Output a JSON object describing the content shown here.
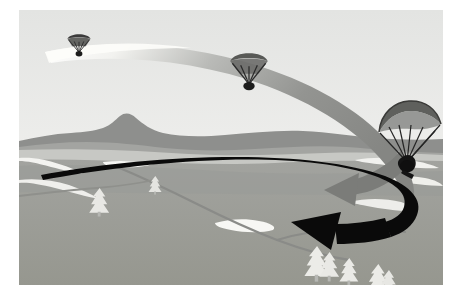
{
  "scene": {
    "title": "Paraglider landing approach diagram",
    "subject": "paragliding flight path over hilly terrain",
    "canvas": {
      "width": 462,
      "height": 302,
      "background": "#ffffff"
    },
    "frame": {
      "x": 19,
      "y": 10,
      "width": 424,
      "height": 275
    }
  },
  "palette": {
    "page_background": "#ffffff",
    "sky_top": "#e6e7e6",
    "sky_bottom": "#f2f2f0",
    "far_ridge": "#8e8f8d",
    "mid_ridge": "#a3a4a1",
    "valley_floor": "#c9c9c6",
    "foreground_field": "#9b9c99",
    "foreground_field_dark": "#949592",
    "track_path": "#8a8b88",
    "snow_patch": "#f4f4f1",
    "trail_band": "#8d8e8c",
    "trail_band_light": "#fafaf7",
    "flight_path_black": "#0a0a0a",
    "arrow_gray": "#7b7c79",
    "tree_light": "#e8e8e4",
    "tree_shadow": "#b6b7b3",
    "glider_dark": "#2a2a2a",
    "glider_canopy": "#6f706d"
  },
  "sky": {
    "label": "Sky",
    "gradient_from": "#e4e5e3",
    "gradient_to": "#f4f4f2"
  },
  "terrain": {
    "label": "Terrain",
    "bands": [
      {
        "name": "far-ridge-line",
        "color": "#8e8f8d",
        "description": "distant dark ridge with peak"
      },
      {
        "name": "mid-ridge-line",
        "color": "#a3a4a1",
        "description": "lighter middle ridge"
      },
      {
        "name": "valley-floor",
        "color": "#c9c9c6",
        "description": "pale valley between ridges"
      },
      {
        "name": "foreground-field",
        "color": "#9b9c99",
        "description": "large foreground meadow"
      }
    ],
    "features": [
      {
        "name": "snow-streak-left",
        "color": "#f4f4f1"
      },
      {
        "name": "snow-streak-center",
        "color": "#f4f4f1"
      },
      {
        "name": "snow-streak-right",
        "color": "#f4f4f1"
      },
      {
        "name": "winding-track",
        "color": "#8a8b88"
      }
    ]
  },
  "gliders": [
    {
      "id": "glider-far",
      "label": "Paraglider at altitude (far)",
      "stage": "high approach",
      "x": 78,
      "y": 40,
      "scale": 0.34,
      "canopy_color": "#3b3b3b",
      "pilot_color": "#1d1d1d"
    },
    {
      "id": "glider-mid",
      "label": "Paraglider descending (mid)",
      "stage": "downwind leg",
      "x": 248,
      "y": 57,
      "scale": 0.52,
      "canopy_color": "#4a4a48",
      "pilot_color": "#1d1d1d"
    },
    {
      "id": "glider-near",
      "label": "Paraglider on final (near)",
      "stage": "final turn to landing",
      "x": 404,
      "y": 118,
      "scale": 1.0,
      "canopy_color": "#5d5e5b",
      "pilot_color": "#141414"
    }
  ],
  "paths": [
    {
      "id": "descent-ribbon",
      "label": "Descent ribbon (airborne trace)",
      "color": "#8d8e8c",
      "highlight_color": "#fbfbf8",
      "description": "wide tapering band sweeping from upper-left down around to the right"
    },
    {
      "id": "ground-track",
      "label": "Flight ground track",
      "color": "#0a0a0a",
      "description": "black tapering curve looping under the glider toward the landing arrow"
    }
  ],
  "arrows": [
    {
      "id": "arrow-wind",
      "label": "Secondary direction arrow",
      "color": "#7b7c79",
      "points_to": "left",
      "tip_x": 305,
      "tip_y": 180
    },
    {
      "id": "arrow-landing",
      "label": "Landing direction arrow",
      "color": "#0a0a0a",
      "points_to": "left",
      "tip_x": 275,
      "tip_y": 212
    }
  ],
  "trees": [
    {
      "id": "tree-1",
      "x": 86,
      "y": 183,
      "scale": 0.95
    },
    {
      "id": "tree-2",
      "x": 138,
      "y": 172,
      "scale": 0.62
    },
    {
      "id": "tree-3",
      "x": 302,
      "y": 245,
      "scale": 1.15
    },
    {
      "id": "tree-4",
      "x": 332,
      "y": 255,
      "scale": 0.85
    },
    {
      "id": "tree-5",
      "x": 360,
      "y": 262,
      "scale": 1.0
    }
  ]
}
